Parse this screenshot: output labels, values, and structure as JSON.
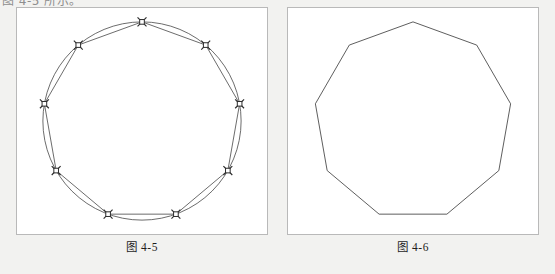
{
  "page": {
    "background_color": "#f2f2f0",
    "clipped_top_text": "图 4-5 所示。"
  },
  "figures": [
    {
      "id": "figure-4-5",
      "caption": "图 4-5",
      "description": "circle with inscribed regular nonagon and marked vertices",
      "panel": {
        "background_color": "#ffffff",
        "border_color": "#b9b9b9"
      },
      "geometry": {
        "type": "circle-with-inscribed-polygon",
        "sides": 9,
        "center": {
          "cx": 126,
          "cy": 114
        },
        "radius": 100,
        "start_angle_deg": -90,
        "show_circle": true,
        "show_polygon": true,
        "show_vertex_markers": true,
        "marker_style": "cross-with-square",
        "marker_size": 9,
        "stroke_color": "#5a5a5a",
        "marker_color": "#2b2b2b"
      }
    },
    {
      "id": "figure-4-6",
      "caption": "图 4-6",
      "description": "regular nonagon outline only",
      "panel": {
        "background_color": "#ffffff",
        "border_color": "#b9b9b9"
      },
      "geometry": {
        "type": "polygon",
        "sides": 9,
        "center": {
          "cx": 126,
          "cy": 114
        },
        "radius": 100,
        "start_angle_deg": -90,
        "show_circle": false,
        "show_polygon": true,
        "show_vertex_markers": false,
        "stroke_color": "#4a4a4a"
      }
    }
  ]
}
